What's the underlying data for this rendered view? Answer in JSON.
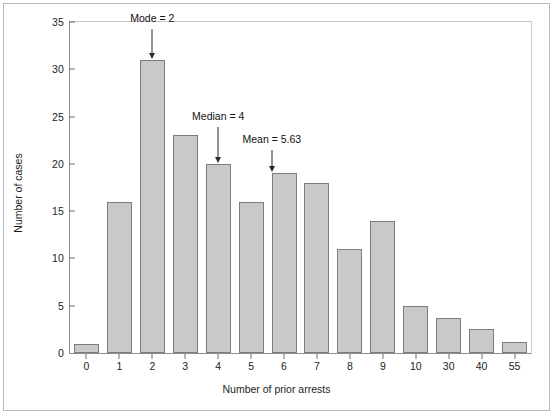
{
  "figure": {
    "background_color": "#ffffff",
    "frame_color": "#b9b9b9",
    "bar_fill_color": "#c9c9c9",
    "bar_border_color": "#7c7c7c",
    "axis_color": "#6f6f6f"
  },
  "chart_data": {
    "type": "bar",
    "title": "",
    "subtitle": "",
    "xlabel": "Number of prior arrests",
    "ylabel": "Number of cases",
    "categories": [
      "0",
      "1",
      "2",
      "3",
      "4",
      "5",
      "6",
      "7",
      "8",
      "9",
      "10",
      "30",
      "40",
      "55"
    ],
    "values": [
      1,
      16,
      31,
      23,
      20,
      16,
      19,
      18,
      11,
      14,
      5,
      3.7,
      2.5,
      1.2
    ],
    "xlim": [
      -0.5,
      13.5
    ],
    "ylim": [
      0,
      35
    ],
    "yticks": [
      0,
      5,
      10,
      15,
      20,
      25,
      30,
      35
    ],
    "ytick_labels": [
      "0",
      "5",
      "10",
      "15",
      "20",
      "25",
      "30",
      "35"
    ],
    "xtick_labels": [
      "0",
      "1",
      "2",
      "3",
      "4",
      "5",
      "6",
      "7",
      "8",
      "9",
      "10",
      "30",
      "40",
      "55"
    ],
    "grid": false,
    "legend": false,
    "legend_position": "none",
    "annotations": [
      {
        "text": "Mode = 2",
        "target_category": "2",
        "target_index": 2,
        "value": 31
      },
      {
        "text": "Median = 4",
        "target_category": "4",
        "target_index": 4,
        "value": 20
      },
      {
        "text": "Mean = 5.63",
        "target_category": "5.63",
        "target_index": 5.63,
        "value": 19
      }
    ]
  }
}
